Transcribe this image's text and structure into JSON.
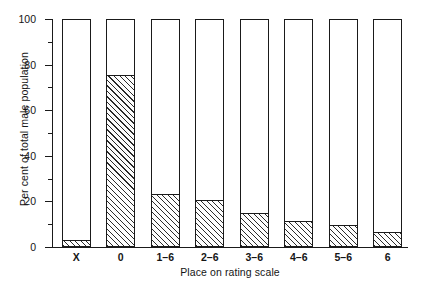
{
  "chart_data": {
    "type": "bar",
    "title": "",
    "subtitle": "",
    "xlabel": "Place on rating scale",
    "ylabel": "Per cent of total male population",
    "categories": [
      "X",
      "0",
      "1–6",
      "2–6",
      "3–6",
      "4–6",
      "5–6",
      "6"
    ],
    "values": [
      2.5,
      75,
      23,
      20,
      14.5,
      11,
      9,
      6
    ],
    "series": [
      {
        "name": "Per cent of total male population",
        "values": [
          2.5,
          75,
          23,
          20,
          14.5,
          11,
          9,
          6
        ]
      }
    ],
    "ylim": [
      0,
      100
    ],
    "xlim": null,
    "grid": false,
    "legend": false,
    "legend_position": "none",
    "bar_outline_to": 100,
    "fill_style": "diagonal-hatch",
    "y_major_ticks": [
      0,
      20,
      40,
      60,
      80,
      100
    ],
    "y_minor_ticks": [
      10,
      30,
      50,
      70,
      90
    ],
    "y_tick_labels": [
      "0",
      "20",
      "40",
      "60",
      "80",
      "100"
    ],
    "colors": {
      "axis": "#1a1a1a",
      "bar_outline": "#1a1a1a",
      "bar_fill": "#ffffff",
      "hatch": "#2a2a2a",
      "text": "#151515",
      "background": "#ffffff"
    }
  }
}
